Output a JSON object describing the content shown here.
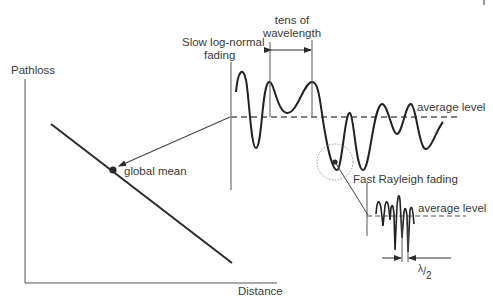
{
  "diagram": {
    "axes": {
      "y_label": "Pathloss",
      "x_label": "Distance"
    },
    "labels": {
      "global_mean": "global mean",
      "slow_fading_line1": "Slow log-normal",
      "slow_fading_line2": "fading",
      "tens_line1": "tens of",
      "tens_line2": "wavelength",
      "average_level_slow": "average level",
      "fast_fading": "Fast Rayleigh fading",
      "average_level_fast": "average level",
      "half_wavelength_num": "λ",
      "half_wavelength_den": "2"
    },
    "colors": {
      "line": "#2a2a2a",
      "text": "#3a3a3a",
      "dashed": "#555555",
      "dotted_circle": "#8a8a8a"
    }
  }
}
